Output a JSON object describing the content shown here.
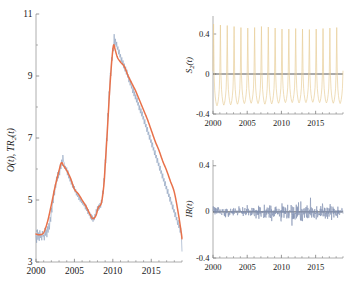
{
  "figure": {
    "background": "#ffffff",
    "axis_color": "#9a9a9a",
    "tick_color": "#7d7d7d",
    "text_color": "#1a1a1a"
  },
  "colors": {
    "observed": "#8fa3bf",
    "trend": "#e8714a",
    "seasonal": "#e8cf9a",
    "irregular": "#7f8fb0",
    "zero_line": "#444444"
  },
  "chart_data": [
    {
      "type": "line",
      "id": "main-panel",
      "title": "",
      "xlabel": "",
      "ylabel": "O(t),  TR₂(t)",
      "ylabel_parts": {
        "first": "O(t)",
        "second": "TR",
        "sub": "2",
        "tail": "(t)"
      },
      "xlim": [
        2000,
        2019
      ],
      "ylim": [
        3,
        11
      ],
      "xticks": [
        2000,
        2005,
        2010,
        2015
      ],
      "xticklabels": [
        "2000",
        "2005",
        "2010",
        "2015"
      ],
      "yticks": [
        3,
        5,
        7,
        9,
        11
      ],
      "yticklabels": [
        "3",
        "5",
        "7",
        "9",
        "11"
      ],
      "yminorticks": [
        4,
        6,
        8,
        10
      ],
      "grid": false,
      "legend": "none",
      "series": [
        {
          "name": "O(t)",
          "color_key": "observed",
          "x": [
            2000.0,
            2000.08,
            2000.17,
            2000.25,
            2000.33,
            2000.42,
            2000.5,
            2000.58,
            2000.67,
            2000.75,
            2000.83,
            2000.92,
            2001.0,
            2001.08,
            2001.17,
            2001.25,
            2001.33,
            2001.42,
            2001.5,
            2001.58,
            2001.67,
            2001.75,
            2001.83,
            2001.92,
            2002.0,
            2002.08,
            2002.17,
            2002.25,
            2002.33,
            2002.42,
            2002.5,
            2002.58,
            2002.67,
            2002.75,
            2002.83,
            2002.92,
            2003.0,
            2003.08,
            2003.17,
            2003.25,
            2003.33,
            2003.42,
            2003.5,
            2003.58,
            2003.67,
            2003.75,
            2003.83,
            2003.92,
            2004.0,
            2004.08,
            2004.17,
            2004.25,
            2004.33,
            2004.42,
            2004.5,
            2004.58,
            2004.67,
            2004.75,
            2004.83,
            2004.92,
            2005.0,
            2005.08,
            2005.17,
            2005.25,
            2005.33,
            2005.42,
            2005.5,
            2005.58,
            2005.67,
            2005.75,
            2005.83,
            2005.92,
            2006.0,
            2006.08,
            2006.17,
            2006.25,
            2006.33,
            2006.42,
            2006.5,
            2006.58,
            2006.67,
            2006.75,
            2006.83,
            2006.92,
            2007.0,
            2007.08,
            2007.17,
            2007.25,
            2007.33,
            2007.42,
            2007.5,
            2007.58,
            2007.67,
            2007.75,
            2007.83,
            2007.92,
            2008.0,
            2008.08,
            2008.17,
            2008.25,
            2008.33,
            2008.42,
            2008.5,
            2008.58,
            2008.67,
            2008.75,
            2008.83,
            2008.92,
            2009.0,
            2009.08,
            2009.17,
            2009.25,
            2009.33,
            2009.42,
            2009.5,
            2009.58,
            2009.67,
            2009.75,
            2009.83,
            2009.92,
            2010.0,
            2010.08,
            2010.17,
            2010.25,
            2010.33,
            2010.42,
            2010.5,
            2010.58,
            2010.67,
            2010.75,
            2010.83,
            2010.92,
            2011.0,
            2011.08,
            2011.17,
            2011.25,
            2011.33,
            2011.42,
            2011.5,
            2011.58,
            2011.67,
            2011.75,
            2011.83,
            2011.92,
            2012.0,
            2012.08,
            2012.17,
            2012.25,
            2012.33,
            2012.42,
            2012.5,
            2012.58,
            2012.67,
            2012.75,
            2012.83,
            2012.92,
            2013.0,
            2013.08,
            2013.17,
            2013.25,
            2013.33,
            2013.42,
            2013.5,
            2013.58,
            2013.67,
            2013.75,
            2013.83,
            2013.92,
            2014.0,
            2014.08,
            2014.17,
            2014.25,
            2014.33,
            2014.42,
            2014.5,
            2014.58,
            2014.67,
            2014.75,
            2014.83,
            2014.92,
            2015.0,
            2015.08,
            2015.17,
            2015.25,
            2015.33,
            2015.42,
            2015.5,
            2015.58,
            2015.67,
            2015.75,
            2015.83,
            2015.92,
            2016.0,
            2016.08,
            2016.17,
            2016.25,
            2016.33,
            2016.42,
            2016.5,
            2016.58,
            2016.67,
            2016.75,
            2016.83,
            2016.92,
            2017.0,
            2017.08,
            2017.17,
            2017.25,
            2017.33,
            2017.42,
            2017.5,
            2017.58,
            2017.67,
            2017.75,
            2017.83,
            2017.92,
            2018.0,
            2018.08,
            2018.17,
            2018.25,
            2018.33,
            2018.42,
            2018.5,
            2018.58,
            2018.67,
            2018.75,
            2018.83,
            2018.92,
            2019.0
          ],
          "values": [
            3.85,
            3.62,
            4.05,
            3.72,
            3.95,
            3.68,
            4.02,
            3.78,
            3.9,
            3.7,
            4.0,
            3.82,
            3.88,
            3.7,
            4.1,
            3.85,
            4.05,
            3.8,
            4.15,
            3.95,
            4.25,
            4.05,
            4.45,
            4.3,
            4.75,
            4.6,
            5.05,
            4.9,
            5.3,
            5.15,
            5.5,
            5.4,
            5.75,
            5.6,
            5.9,
            5.7,
            5.95,
            5.8,
            6.15,
            6.0,
            6.3,
            6.1,
            6.45,
            6.25,
            6.2,
            6.0,
            6.1,
            5.95,
            6.05,
            5.8,
            5.95,
            5.7,
            5.8,
            5.6,
            5.7,
            5.5,
            5.6,
            5.4,
            5.5,
            5.35,
            5.45,
            5.25,
            5.35,
            5.15,
            5.25,
            5.1,
            5.2,
            5.0,
            5.1,
            4.95,
            5.05,
            4.9,
            5.0,
            4.85,
            4.95,
            4.8,
            4.9,
            4.7,
            4.85,
            4.65,
            4.75,
            4.55,
            4.7,
            4.5,
            4.6,
            4.4,
            4.55,
            4.35,
            4.5,
            4.3,
            4.45,
            4.35,
            4.55,
            4.45,
            4.7,
            4.6,
            4.8,
            4.65,
            4.85,
            4.7,
            4.9,
            4.75,
            5.0,
            4.9,
            5.3,
            5.2,
            5.7,
            5.6,
            6.3,
            6.2,
            7.0,
            6.9,
            7.8,
            7.7,
            8.5,
            8.4,
            9.1,
            9.0,
            9.6,
            9.5,
            9.9,
            9.8,
            10.35,
            10.0,
            10.2,
            9.95,
            10.1,
            9.85,
            9.95,
            9.7,
            9.85,
            9.6,
            9.7,
            9.45,
            9.6,
            9.35,
            9.5,
            9.25,
            9.4,
            9.15,
            9.3,
            9.05,
            9.2,
            8.95,
            9.05,
            8.8,
            8.95,
            8.7,
            8.85,
            8.6,
            8.7,
            8.45,
            8.6,
            8.35,
            8.5,
            8.25,
            8.4,
            8.15,
            8.3,
            8.05,
            8.15,
            7.9,
            8.05,
            7.8,
            7.95,
            7.7,
            7.85,
            7.6,
            7.7,
            7.45,
            7.6,
            7.35,
            7.45,
            7.2,
            7.35,
            7.1,
            7.2,
            6.95,
            7.1,
            6.85,
            6.95,
            6.7,
            6.85,
            6.6,
            6.7,
            6.45,
            6.6,
            6.35,
            6.45,
            6.2,
            6.35,
            6.1,
            6.2,
            5.95,
            6.1,
            5.85,
            5.95,
            5.7,
            5.85,
            5.6,
            5.7,
            5.45,
            5.6,
            5.35,
            5.45,
            5.2,
            5.35,
            5.1,
            5.2,
            4.95,
            5.1,
            4.85,
            4.95,
            4.7,
            4.85,
            4.6,
            4.7,
            4.45,
            4.6,
            4.35,
            4.45,
            4.2,
            4.35,
            4.1,
            4.2,
            3.95,
            4.1,
            3.85,
            3.35
          ]
        },
        {
          "name": "TR2(t)",
          "color_key": "trend",
          "x": [
            2000.0,
            2000.5,
            2001.0,
            2001.5,
            2002.0,
            2002.5,
            2003.0,
            2003.3,
            2003.6,
            2004.0,
            2004.5,
            2005.0,
            2005.5,
            2006.0,
            2006.5,
            2007.0,
            2007.4,
            2007.8,
            2008.1,
            2008.5,
            2008.8,
            2009.0,
            2009.3,
            2009.6,
            2009.9,
            2010.1,
            2010.3,
            2010.6,
            2011.0,
            2011.5,
            2012.0,
            2012.5,
            2013.0,
            2013.5,
            2014.0,
            2014.5,
            2015.0,
            2015.5,
            2016.0,
            2016.5,
            2017.0,
            2017.5,
            2018.0,
            2018.5,
            2018.9,
            2019.0
          ],
          "values": [
            3.9,
            3.88,
            3.95,
            4.3,
            4.85,
            5.45,
            5.95,
            6.2,
            6.1,
            5.95,
            5.7,
            5.35,
            5.2,
            5.0,
            4.8,
            4.55,
            4.4,
            4.5,
            4.75,
            4.9,
            5.4,
            6.1,
            7.3,
            8.6,
            9.6,
            10.0,
            9.85,
            9.6,
            9.45,
            9.3,
            9.0,
            8.75,
            8.5,
            8.2,
            7.9,
            7.6,
            7.25,
            6.9,
            6.6,
            6.25,
            5.95,
            5.6,
            5.25,
            4.6,
            3.95,
            3.75
          ]
        }
      ]
    },
    {
      "type": "line",
      "id": "seasonal-panel",
      "title": "",
      "xlabel": "",
      "ylabel": "S₂(t)",
      "ylabel_parts": {
        "first": "S",
        "sub": "2",
        "tail": "(t)"
      },
      "xlim": [
        2000,
        2019
      ],
      "ylim": [
        -0.4,
        0.58
      ],
      "xticks": [
        2000,
        2005,
        2010,
        2015
      ],
      "xticklabels": [
        "2000",
        "2005",
        "2010",
        "2015"
      ],
      "yticks": [
        -0.4,
        0,
        0.4
      ],
      "yticklabels": [
        "-0.4",
        "0",
        "0.4"
      ],
      "grid": false,
      "legend": "none",
      "zero_line": 0,
      "description": "Annual seasonal component: sharp yearly spikes reaching about +0.5 with troughs near -0.3",
      "series": [
        {
          "name": "S2(t)",
          "color_key": "seasonal",
          "period": 1.0,
          "samples_per_year": 12,
          "peak": 0.52,
          "trough": -0.32,
          "peak_phase": 0.08,
          "amplitude_envelope": [
            1.0,
            0.98,
            0.97,
            0.95,
            0.93,
            0.92,
            0.93,
            0.95,
            0.94,
            0.92,
            0.9,
            0.9,
            0.91,
            0.9,
            0.89,
            0.9,
            0.91,
            0.92,
            0.93,
            0.94
          ]
        }
      ]
    },
    {
      "type": "line",
      "id": "irregular-panel",
      "title": "",
      "xlabel": "",
      "ylabel": "IR(t)",
      "xlim": [
        2000,
        2019
      ],
      "ylim": [
        -0.4,
        0.45
      ],
      "xticks": [
        2000,
        2005,
        2010,
        2015
      ],
      "xticklabels": [
        "2000",
        "2005",
        "2010",
        "2015"
      ],
      "yticks": [
        -0.4,
        0,
        0.4
      ],
      "yticklabels": [
        "-0.4",
        "0",
        "0.4"
      ],
      "grid": false,
      "legend": "none",
      "zero_line": 0,
      "description": "Irregular residual component: white-noise-like fluctuations mostly within plus or minus 0.1, occasional spikes to 0.2",
      "series": [
        {
          "name": "IR(t)",
          "color_key": "irregular",
          "mean": 0.0,
          "typical_abs": 0.06,
          "max": 0.21,
          "min": -0.19,
          "samples_per_year": 24
        }
      ]
    }
  ]
}
